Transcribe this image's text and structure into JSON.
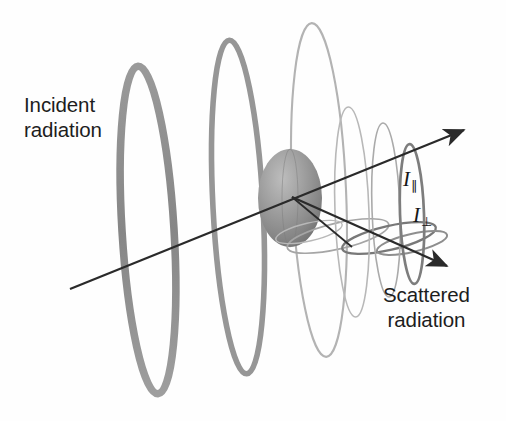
{
  "figure": {
    "kind": "light-scattering-diagram",
    "background_color": "#fefefe",
    "width": 506,
    "height": 421
  },
  "labels": {
    "incident_line1": "Incident",
    "incident_line2": "radiation",
    "scattered_line1": "Scattered",
    "scattered_line2": "radiation",
    "i_parallel_symbol": "I",
    "i_parallel_subscript": "∥",
    "i_perpendicular_symbol": "I",
    "i_perpendicular_subscript": "⊥",
    "text_color": "#1d1d1d"
  },
  "colors": {
    "incident_wave": "#8e8e8e",
    "incident_wave_dark": "#7a7a7a",
    "scattered_wave_light": "#b9b9b9",
    "scattered_wave_mid": "#9c9c9c",
    "scattered_wave_dark": "#6f6f6f",
    "particle_fill": "#8d8d8d",
    "particle_highlight": "#b4b4b4",
    "particle_shadow": "#6e6e6e",
    "axis_line": "#2a2a2a",
    "background": "#fefefe"
  },
  "geometry": {
    "axis_start_x": 70,
    "axis_start_y": 289,
    "axis_forward_arrow_x": 466,
    "axis_forward_arrow_y": 128,
    "axis_scatter_arrow_x": 449,
    "axis_scatter_arrow_y": 268,
    "particle_center_x": 290,
    "particle_center_y": 198,
    "particle_radius_x": 32,
    "particle_radius_y": 49
  },
  "incident_wave_loops": [
    {
      "cx": 148,
      "cy": 230,
      "rx": 26,
      "ry": 164,
      "tilt": -3.5,
      "stroke": 7.5,
      "color": "#8a8a8a"
    },
    {
      "cx": 238,
      "cy": 205,
      "rx": 25,
      "ry": 167,
      "tilt": -3.0,
      "stroke": 5.5,
      "color": "#959595"
    },
    {
      "cx": 318,
      "cy": 188,
      "rx": 26,
      "ry": 167,
      "tilt": -2.5,
      "stroke": 2.0,
      "color": "#b2b2b2"
    }
  ],
  "scattered_wave_loops": [
    {
      "cx": 352,
      "cy": 210,
      "rx": 17,
      "ry": 104,
      "tilt": -2.0,
      "stroke": 1.6,
      "color": "#b6b6b6"
    },
    {
      "cx": 385,
      "cy": 208,
      "rx": 14,
      "ry": 86,
      "tilt": -2.0,
      "stroke": 1.6,
      "color": "#a8a8a8"
    },
    {
      "cx": 411,
      "cy": 212,
      "rx": 12,
      "ry": 70,
      "tilt": -2.0,
      "stroke": 2.6,
      "color": "#7b7b7b"
    }
  ],
  "perpendicular_rings": [
    {
      "cx": 338,
      "cy": 236,
      "rx": 52,
      "ry": 13,
      "tilt": -13,
      "stroke": 1.6,
      "color": "#a3a3a3"
    },
    {
      "cx": 388,
      "cy": 238,
      "rx": 48,
      "ry": 12,
      "tilt": -13,
      "stroke": 2.2,
      "color": "#767676"
    },
    {
      "cx": 411,
      "cy": 242,
      "rx": 36,
      "ry": 9,
      "tilt": -13,
      "stroke": 2.0,
      "color": "#8c8c8c"
    }
  ]
}
